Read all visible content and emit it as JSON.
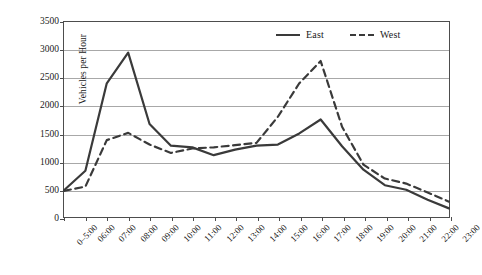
{
  "chart_data": {
    "type": "line",
    "title": "",
    "xlabel": "",
    "ylabel": "Vehicles per Hour",
    "ylim": [
      0,
      3500
    ],
    "ytick_step": 500,
    "yticks": [
      0,
      500,
      1000,
      1500,
      2000,
      2500,
      3000,
      3500
    ],
    "ytick_labels": [
      "0",
      "500",
      "1000",
      "1500",
      "2000",
      "2500",
      "3000",
      "3500"
    ],
    "grid": "horizontal",
    "legend_position": "top-right",
    "categories": [
      "0–5:00",
      "06:00",
      "07:00",
      "08:00",
      "09:00",
      "10:00",
      "11:00",
      "12:00",
      "13:00",
      "14:00",
      "15:00",
      "16:00",
      "17:00",
      "18:00",
      "19:00",
      "20:00",
      "21:00",
      "22:00",
      "23:00"
    ],
    "series": [
      {
        "name": "East",
        "style": "solid",
        "color": "#3a3a3a",
        "values": [
          480,
          830,
          2400,
          2950,
          1670,
          1280,
          1250,
          1110,
          1210,
          1280,
          1300,
          1500,
          1750,
          1270,
          850,
          570,
          490,
          310,
          155
        ]
      },
      {
        "name": "West",
        "style": "dashed",
        "color": "#3a3a3a",
        "values": [
          470,
          545,
          1380,
          1510,
          1300,
          1150,
          1230,
          1250,
          1290,
          1330,
          1800,
          2400,
          2800,
          1620,
          940,
          690,
          600,
          440,
          275
        ]
      }
    ]
  },
  "legend": {
    "entries": [
      {
        "label": "East",
        "style": "solid"
      },
      {
        "label": "West",
        "style": "dashed"
      }
    ]
  },
  "axis": {
    "y_title": "Vehicles per Hour"
  },
  "colors": {
    "series_line": "#3a3a3a",
    "gridline": "#a8a8a8",
    "frame": "#4d4d4d",
    "background": "#ffffff",
    "text": "#1a1a1a"
  }
}
